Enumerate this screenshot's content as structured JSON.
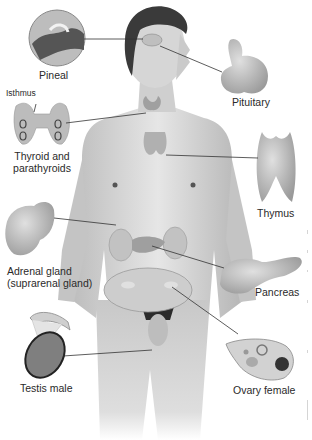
{
  "diagram": {
    "colors": {
      "background": "#ffffff",
      "skin": "#d9d9d9",
      "skin_shade": "#a8a8a8",
      "hair": "#3a3a3a",
      "gland": "#b8b8b8",
      "leader_line": "#333333",
      "text": "#2a2a2a"
    },
    "labels": {
      "pineal": "Pineal",
      "pituitary": "Pituitary",
      "isthmus": "Isthmus",
      "thyroid_line1": "Thyroid and",
      "thyroid_line2": "parathyroids",
      "thymus": "Thymus",
      "adrenal_line1": "Adrenal gland",
      "adrenal_line2": "(suprarenal gland)",
      "pancreas": "Pancreas",
      "testis": "Testis male",
      "ovary": "Ovary female"
    }
  }
}
